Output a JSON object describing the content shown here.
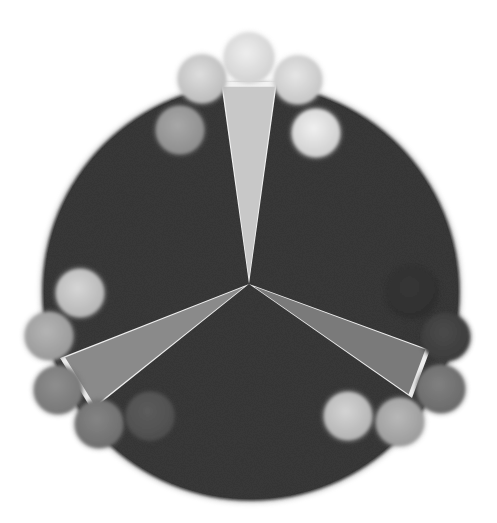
{
  "illustration": {
    "description": "Grayscale illustration of a dark disc divided by three light wedges radiating from the center, with groups of spheres arranged around the edge",
    "canvas": {
      "width": 497,
      "height": 523,
      "background": "#ffffff"
    },
    "disc": {
      "cx": 251,
      "cy": 292,
      "r": 209,
      "color": "#3a3a3a"
    },
    "center": {
      "x": 249,
      "y": 284
    },
    "wedges": [
      {
        "name": "top",
        "points": "249,284 221,82 277,82",
        "fill": "#c8c8c8",
        "edge": "#f2f2f2"
      },
      {
        "name": "left",
        "points": "249,284 60,358 92,410",
        "fill": "#8a8a8a",
        "edge": "#eeeeee"
      },
      {
        "name": "right",
        "points": "249,284 430,350 412,398",
        "fill": "#7a7a7a",
        "edge": "#eeeeee"
      }
    ],
    "spheres": [
      {
        "group": "top",
        "cx": 249,
        "cy": 58,
        "r": 25,
        "shade": "#d2d2d2",
        "highlight": "#eeeeee"
      },
      {
        "group": "top",
        "cx": 202,
        "cy": 79,
        "r": 24,
        "shade": "#bcbcbc",
        "highlight": "#dedede"
      },
      {
        "group": "top",
        "cx": 298,
        "cy": 80,
        "r": 24,
        "shade": "#c6c6c6",
        "highlight": "#e6e6e6"
      },
      {
        "group": "top",
        "cx": 180,
        "cy": 130,
        "r": 24,
        "shade": "#8e8e8e",
        "highlight": "#a8a8a8"
      },
      {
        "group": "top",
        "cx": 316,
        "cy": 133,
        "r": 24,
        "shade": "#cfcfcf",
        "highlight": "#f0f0f0"
      },
      {
        "group": "left",
        "cx": 80,
        "cy": 293,
        "r": 24,
        "shade": "#b6b6b6",
        "highlight": "#d6d6d6"
      },
      {
        "group": "left",
        "cx": 49,
        "cy": 336,
        "r": 24,
        "shade": "#9a9a9a",
        "highlight": "#b4b4b4"
      },
      {
        "group": "left",
        "cx": 58,
        "cy": 390,
        "r": 24,
        "shade": "#777777",
        "highlight": "#8e8e8e"
      },
      {
        "group": "left",
        "cx": 99,
        "cy": 424,
        "r": 24,
        "shade": "#6e6e6e",
        "highlight": "#848484"
      },
      {
        "group": "left",
        "cx": 150,
        "cy": 416,
        "r": 24,
        "shade": "#4e4e4e",
        "highlight": "#5c5c5c"
      },
      {
        "group": "right",
        "cx": 446,
        "cy": 337,
        "r": 24,
        "shade": "#3c3c3c",
        "highlight": "#4a4a4a"
      },
      {
        "group": "right",
        "cx": 441,
        "cy": 389,
        "r": 24,
        "shade": "#6a6a6a",
        "highlight": "#808080"
      },
      {
        "group": "right",
        "cx": 400,
        "cy": 422,
        "r": 24,
        "shade": "#9c9c9c",
        "highlight": "#b8b8b8"
      },
      {
        "group": "right",
        "cx": 348,
        "cy": 416,
        "r": 24,
        "shade": "#b4b4b4",
        "highlight": "#d4d4d4"
      },
      {
        "group": "right",
        "cx": 412,
        "cy": 292,
        "r": 26,
        "shade": "#2e2e2e",
        "highlight": "#363636"
      }
    ]
  }
}
